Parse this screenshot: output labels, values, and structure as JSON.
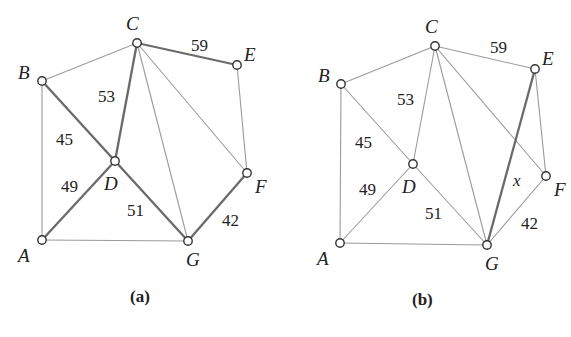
{
  "panels": [
    {
      "caption": "(a)",
      "caption_pos": [
        130,
        302
      ],
      "nodes": [
        {
          "id": "A",
          "x": 42,
          "y": 240,
          "lx": 18,
          "ly": 262
        },
        {
          "id": "B",
          "x": 42,
          "y": 81,
          "lx": 18,
          "ly": 79
        },
        {
          "id": "C",
          "x": 137,
          "y": 43,
          "lx": 126,
          "ly": 30
        },
        {
          "id": "D",
          "x": 115,
          "y": 161,
          "lx": 104,
          "ly": 190
        },
        {
          "id": "E",
          "x": 237,
          "y": 65,
          "lx": 244,
          "ly": 61
        },
        {
          "id": "F",
          "x": 247,
          "y": 173,
          "lx": 255,
          "ly": 193
        },
        {
          "id": "G",
          "x": 188,
          "y": 241,
          "lx": 186,
          "ly": 266
        }
      ],
      "edges": [
        {
          "from": "A",
          "to": "B",
          "bold": false
        },
        {
          "from": "B",
          "to": "C",
          "bold": false
        },
        {
          "from": "A",
          "to": "G",
          "bold": false
        },
        {
          "from": "C",
          "to": "G",
          "bold": false
        },
        {
          "from": "C",
          "to": "F",
          "bold": false
        },
        {
          "from": "E",
          "to": "F",
          "bold": false
        },
        {
          "from": "B",
          "to": "D",
          "bold": true
        },
        {
          "from": "C",
          "to": "D",
          "bold": true
        },
        {
          "from": "A",
          "to": "D",
          "bold": true
        },
        {
          "from": "D",
          "to": "G",
          "bold": true
        },
        {
          "from": "C",
          "to": "E",
          "bold": true
        },
        {
          "from": "F",
          "to": "G",
          "bold": true
        }
      ],
      "weights": [
        {
          "text": "59",
          "x": 191,
          "y": 51
        },
        {
          "text": "53",
          "x": 98,
          "y": 102
        },
        {
          "text": "45",
          "x": 56,
          "y": 145
        },
        {
          "text": "49",
          "x": 61,
          "y": 192
        },
        {
          "text": "51",
          "x": 127,
          "y": 216
        },
        {
          "text": "42",
          "x": 222,
          "y": 226
        }
      ]
    },
    {
      "caption": "(b)",
      "caption_pos": [
        412,
        305
      ],
      "nodes": [
        {
          "id": "A",
          "x": 340,
          "y": 243,
          "lx": 317,
          "ly": 265
        },
        {
          "id": "B",
          "x": 341,
          "y": 84,
          "lx": 318,
          "ly": 82
        },
        {
          "id": "C",
          "x": 435,
          "y": 46,
          "lx": 425,
          "ly": 33
        },
        {
          "id": "D",
          "x": 413,
          "y": 164,
          "lx": 402,
          "ly": 193
        },
        {
          "id": "E",
          "x": 535,
          "y": 69,
          "lx": 542,
          "ly": 65
        },
        {
          "id": "F",
          "x": 546,
          "y": 176,
          "lx": 554,
          "ly": 196
        },
        {
          "id": "G",
          "x": 487,
          "y": 245,
          "lx": 485,
          "ly": 270
        }
      ],
      "edges": [
        {
          "from": "A",
          "to": "B",
          "bold": false
        },
        {
          "from": "B",
          "to": "C",
          "bold": false
        },
        {
          "from": "A",
          "to": "G",
          "bold": false
        },
        {
          "from": "C",
          "to": "G",
          "bold": false
        },
        {
          "from": "C",
          "to": "F",
          "bold": false
        },
        {
          "from": "E",
          "to": "F",
          "bold": false
        },
        {
          "from": "B",
          "to": "D",
          "bold": false
        },
        {
          "from": "C",
          "to": "D",
          "bold": false
        },
        {
          "from": "A",
          "to": "D",
          "bold": false
        },
        {
          "from": "D",
          "to": "G",
          "bold": false
        },
        {
          "from": "C",
          "to": "E",
          "bold": false
        },
        {
          "from": "F",
          "to": "G",
          "bold": false
        },
        {
          "from": "E",
          "to": "G",
          "bold": true
        }
      ],
      "weights": [
        {
          "text": "59",
          "x": 490,
          "y": 53
        },
        {
          "text": "53",
          "x": 397,
          "y": 105
        },
        {
          "text": "45",
          "x": 355,
          "y": 148
        },
        {
          "text": "49",
          "x": 359,
          "y": 195
        },
        {
          "text": "51",
          "x": 425,
          "y": 219
        },
        {
          "text": "42",
          "x": 521,
          "y": 229
        },
        {
          "text": "x",
          "x": 513,
          "y": 186,
          "italic": true
        }
      ]
    }
  ]
}
